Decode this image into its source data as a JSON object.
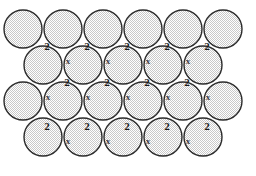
{
  "figure": {
    "type": "symmetry-diagram",
    "background_color": "#ffffff",
    "stroke_color": "#2b2b2b",
    "fill_color": "#dcdcdc",
    "fill_pattern": "stipple-dots",
    "label_color": "#1a1a1a",
    "glide_label_color": "#3c3c46",
    "width": 256,
    "height": 176
  },
  "geometry": {
    "circle_radius": 19,
    "row_step_y": 36,
    "col_step_x": 40,
    "rows": [
      {
        "index": 0,
        "count": 6,
        "cy": 29,
        "x_start": 23,
        "x_step": 40
      },
      {
        "index": 1,
        "count": 5,
        "cy": 65,
        "x_start": 43,
        "x_step": 40
      },
      {
        "index": 2,
        "count": 6,
        "cy": 101,
        "x_start": 23,
        "x_step": 40
      },
      {
        "index": 3,
        "count": 5,
        "cy": 137,
        "x_start": 43,
        "x_step": 40
      }
    ]
  },
  "annotations": {
    "rotation_symbol": "2",
    "glide_symbol": "x",
    "rotation_centers": [
      {
        "label": "2",
        "x": 47,
        "y": 46
      },
      {
        "label": "2",
        "x": 87,
        "y": 46
      },
      {
        "label": "2",
        "x": 127,
        "y": 46
      },
      {
        "label": "2",
        "x": 167,
        "y": 46
      },
      {
        "label": "2",
        "x": 207,
        "y": 46
      },
      {
        "label": "2",
        "x": 67,
        "y": 82
      },
      {
        "label": "2",
        "x": 107,
        "y": 82
      },
      {
        "label": "2",
        "x": 147,
        "y": 82
      },
      {
        "label": "2",
        "x": 187,
        "y": 82
      },
      {
        "label": "2",
        "x": 47,
        "y": 126
      },
      {
        "label": "2",
        "x": 87,
        "y": 126
      },
      {
        "label": "2",
        "x": 127,
        "y": 126
      },
      {
        "label": "2",
        "x": 167,
        "y": 126
      },
      {
        "label": "2",
        "x": 207,
        "y": 126
      }
    ],
    "glide_centers": [
      {
        "label": "x",
        "x": 68,
        "y": 61
      },
      {
        "label": "x",
        "x": 108,
        "y": 61
      },
      {
        "label": "x",
        "x": 148,
        "y": 61
      },
      {
        "label": "x",
        "x": 188,
        "y": 61
      },
      {
        "label": "x",
        "x": 48,
        "y": 97
      },
      {
        "label": "x",
        "x": 88,
        "y": 97
      },
      {
        "label": "x",
        "x": 128,
        "y": 97
      },
      {
        "label": "x",
        "x": 168,
        "y": 97
      },
      {
        "label": "x",
        "x": 208,
        "y": 97
      },
      {
        "label": "x",
        "x": 68,
        "y": 141
      },
      {
        "label": "x",
        "x": 108,
        "y": 141
      },
      {
        "label": "x",
        "x": 148,
        "y": 141
      },
      {
        "label": "x",
        "x": 188,
        "y": 141
      }
    ]
  }
}
